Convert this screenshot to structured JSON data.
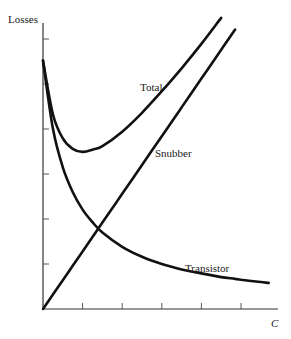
{
  "chart_data": {
    "type": "line",
    "title": "",
    "xlabel": "C",
    "ylabel": "Losses",
    "xlim": [
      0,
      5.9
    ],
    "ylim": [
      0,
      6.8
    ],
    "grid": false,
    "legend": "none (inline curve labels)",
    "x_ticks": [
      1,
      2,
      3,
      4,
      5
    ],
    "y_ticks": [
      1,
      2,
      3,
      4,
      5,
      6
    ],
    "tick_labels_shown": false,
    "x": [
      0,
      0.25,
      0.5,
      0.75,
      1.0,
      1.25,
      1.5,
      2.0,
      2.5,
      3.0,
      3.5,
      4.0,
      4.5,
      4.85,
      5.0,
      5.5,
      5.7
    ],
    "series": [
      {
        "name": "Total",
        "values": [
          5.52,
          4.33,
          3.79,
          3.56,
          3.49,
          3.54,
          3.62,
          3.94,
          4.36,
          4.84,
          5.35,
          5.89,
          6.47,
          null,
          null,
          null,
          null
        ]
      },
      {
        "name": "Snubber",
        "values": [
          0,
          0.32,
          0.64,
          0.96,
          1.28,
          1.6,
          1.92,
          2.56,
          3.2,
          3.84,
          4.48,
          5.12,
          5.76,
          6.21,
          null,
          null,
          null
        ]
      },
      {
        "name": "Transistor",
        "values": [
          5.52,
          4.01,
          3.15,
          2.6,
          2.21,
          1.93,
          1.7,
          1.38,
          1.16,
          1.0,
          0.88,
          0.79,
          0.71,
          0.67,
          0.65,
          0.6,
          0.58
        ]
      }
    ],
    "annotations": [
      {
        "text": "Total",
        "near_series": "Total"
      },
      {
        "text": "Snubber",
        "near_series": "Snubber"
      },
      {
        "text": "Transistor",
        "near_series": "Transistor"
      }
    ]
  },
  "labels": {
    "y_axis": "Losses",
    "x_axis": "C",
    "total": "Total",
    "snubber": "Snubber",
    "transistor": "Transistor"
  },
  "colors": {
    "line": "#111111",
    "axis": "#333333",
    "background": "#ffffff"
  }
}
